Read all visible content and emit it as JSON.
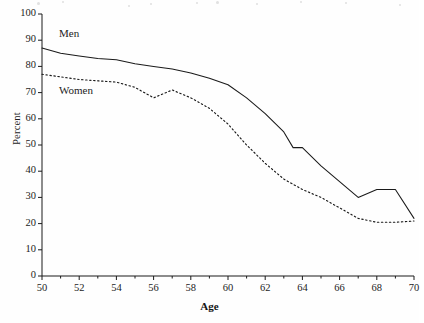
{
  "chart_data": {
    "type": "line",
    "title": "",
    "xlabel": "Age",
    "ylabel": "Percent",
    "xlim": [
      50,
      70
    ],
    "ylim": [
      0,
      100
    ],
    "xticks": [
      50,
      52,
      54,
      56,
      58,
      60,
      62,
      64,
      66,
      68,
      70
    ],
    "xticks_minor": [
      51,
      53,
      55,
      57,
      59,
      61,
      63,
      65,
      67,
      69
    ],
    "yticks": [
      0,
      10,
      20,
      30,
      40,
      50,
      60,
      70,
      80,
      90,
      100
    ],
    "grid": false,
    "legend_position": "inline-annotation",
    "series": [
      {
        "name": "Men",
        "style": "solid",
        "color": "#1a1a1a",
        "x": [
          50,
          51,
          52,
          53,
          54,
          55,
          56,
          57,
          58,
          59,
          60,
          61,
          62,
          63,
          63.5,
          64,
          65,
          66,
          67,
          68,
          69,
          70
        ],
        "values": [
          87,
          85,
          84,
          83,
          82.5,
          81,
          80,
          79,
          77.5,
          75.5,
          73,
          68,
          62,
          55,
          49,
          49,
          42,
          36,
          30,
          33,
          33,
          22
        ]
      },
      {
        "name": "Women",
        "style": "dotted",
        "color": "#1a1a1a",
        "x": [
          50,
          51,
          52,
          53,
          54,
          55,
          56,
          57,
          58,
          59,
          60,
          61,
          62,
          63,
          64,
          65,
          66,
          67,
          68,
          69,
          70
        ],
        "values": [
          77,
          76,
          75,
          74.5,
          74,
          72,
          68,
          71,
          68,
          64,
          58,
          50,
          43,
          37,
          33,
          30,
          26,
          22,
          20.5,
          20.5,
          21
        ]
      }
    ],
    "annotations": [
      {
        "text": "Men",
        "x": 50.9,
        "y": 91
      },
      {
        "text": "Women",
        "x": 50.9,
        "y": 69
      }
    ]
  }
}
